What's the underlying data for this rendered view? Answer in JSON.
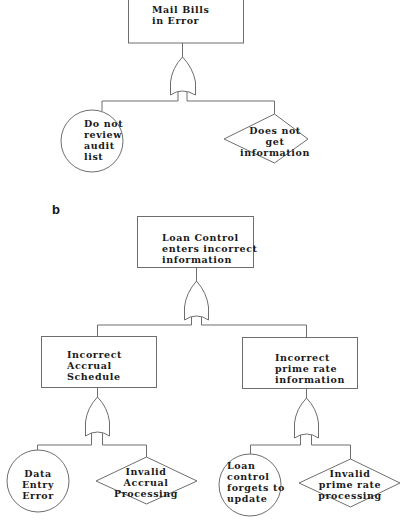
{
  "panel_b_label": "b",
  "tree_a": {
    "top_event": {
      "type": "rectangle",
      "lines": [
        "Mail Bills",
        "in Error"
      ]
    },
    "gate": {
      "type": "OR"
    },
    "children": [
      {
        "type": "circle",
        "lines": [
          "Do not",
          "review",
          "audit",
          "list"
        ]
      },
      {
        "type": "diamond",
        "lines": [
          "Does not",
          "get",
          "information"
        ]
      }
    ]
  },
  "tree_b": {
    "top_event": {
      "type": "rectangle",
      "lines": [
        "Loan Control",
        "enters incorrect",
        "information"
      ]
    },
    "gate": {
      "type": "OR"
    },
    "intermediate": [
      {
        "type": "rectangle",
        "lines": [
          "Incorrect",
          "Accrual",
          "Schedule"
        ],
        "gate": {
          "type": "OR"
        },
        "children": [
          {
            "type": "circle",
            "lines": [
              "Data",
              "Entry",
              "Error"
            ]
          },
          {
            "type": "diamond",
            "lines": [
              "Invalid",
              "Accrual",
              "Processing"
            ]
          }
        ]
      },
      {
        "type": "rectangle",
        "lines": [
          "Incorrect",
          "prime rate",
          "information"
        ],
        "gate": {
          "type": "OR"
        },
        "children": [
          {
            "type": "circle",
            "lines": [
              "Loan",
              "control",
              "forgets to",
              "update"
            ]
          },
          {
            "type": "diamond",
            "lines": [
              "Invalid",
              "prime rate",
              "processing"
            ]
          }
        ]
      }
    ]
  },
  "colors": {
    "stroke": "#6e6e6e",
    "text": "#1a1a1a",
    "background": "#ffffff"
  }
}
